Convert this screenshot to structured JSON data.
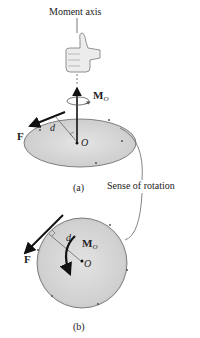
{
  "figure": {
    "moment_axis_label": "Moment axis",
    "sense_of_rotation_label": "Sense of rotation",
    "panel_a": {
      "caption": "(a)",
      "force_label": "F",
      "distance_label": "d",
      "point_label": "O",
      "moment_label": "M",
      "moment_subscript": "O"
    },
    "panel_b": {
      "caption": "(b)",
      "force_label": "F",
      "distance_label": "d",
      "point_label": "O",
      "moment_label": "M",
      "moment_subscript": "O"
    },
    "colors": {
      "disk_fill": "#d6d6d6",
      "outline": "#555555",
      "arrow": "#111111",
      "hand": "#e8e8e8"
    }
  }
}
